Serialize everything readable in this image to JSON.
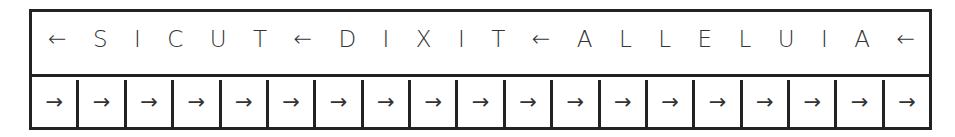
{
  "banner": {
    "glyphs": [
      {
        "char": "←",
        "kind": "arrow"
      },
      {
        "char": "S",
        "kind": "letter"
      },
      {
        "char": "I",
        "kind": "letter"
      },
      {
        "char": "C",
        "kind": "letter"
      },
      {
        "char": "U",
        "kind": "letter"
      },
      {
        "char": "T",
        "kind": "letter"
      },
      {
        "char": "←",
        "kind": "arrow"
      },
      {
        "char": "D",
        "kind": "letter"
      },
      {
        "char": "I",
        "kind": "letter"
      },
      {
        "char": "X",
        "kind": "letter"
      },
      {
        "char": "I",
        "kind": "letter"
      },
      {
        "char": "T",
        "kind": "letter"
      },
      {
        "char": "←",
        "kind": "arrow"
      },
      {
        "char": "A",
        "kind": "letter"
      },
      {
        "char": "L",
        "kind": "letter"
      },
      {
        "char": "L",
        "kind": "letter"
      },
      {
        "char": "E",
        "kind": "letter"
      },
      {
        "char": "L",
        "kind": "letter"
      },
      {
        "char": "U",
        "kind": "letter"
      },
      {
        "char": "I",
        "kind": "letter"
      },
      {
        "char": "A",
        "kind": "letter"
      },
      {
        "char": "←",
        "kind": "arrow"
      }
    ],
    "words": [
      "SICUT",
      "DIXIT",
      "ALLELUIA"
    ]
  },
  "cells": [
    {
      "char": "→"
    },
    {
      "char": "→"
    },
    {
      "char": "→"
    },
    {
      "char": "→"
    },
    {
      "char": "→"
    },
    {
      "char": "→"
    },
    {
      "char": "→"
    },
    {
      "char": "→"
    },
    {
      "char": "→"
    },
    {
      "char": "→"
    },
    {
      "char": "→"
    },
    {
      "char": "→"
    },
    {
      "char": "→"
    },
    {
      "char": "→"
    },
    {
      "char": "→"
    },
    {
      "char": "→"
    },
    {
      "char": "→"
    },
    {
      "char": "→"
    },
    {
      "char": "→"
    }
  ],
  "colors": {
    "border": "#222222",
    "text": "#333333",
    "background": "#ffffff"
  }
}
